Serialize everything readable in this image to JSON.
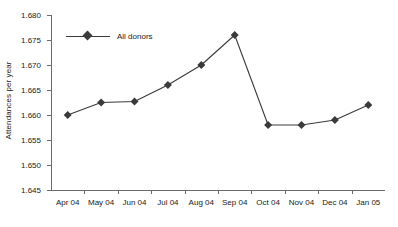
{
  "chart_data": {
    "type": "line",
    "title": "",
    "xlabel": "",
    "ylabel": "Attendances per year",
    "categories": [
      "Apr 04",
      "May 04",
      "Jun 04",
      "Jul 04",
      "Aug 04",
      "Sep 04",
      "Oct 04",
      "Nov 04",
      "Dec 04",
      "Jan 05"
    ],
    "series": [
      {
        "name": "All donors",
        "values": [
          1.66,
          1.6625,
          1.6627,
          1.666,
          1.67,
          1.676,
          1.658,
          1.658,
          1.659,
          1.662
        ],
        "color": "#3a3a3a",
        "marker": "diamond"
      }
    ],
    "ylim": [
      1.645,
      1.68
    ],
    "ytick_step": 0.005,
    "ytick_labels": [
      "1.680",
      "1.675",
      "1.670",
      "1.665",
      "1.660",
      "1.655",
      "1.650",
      "1.645"
    ],
    "ytick_values": [
      1.68,
      1.675,
      1.67,
      1.665,
      1.66,
      1.655,
      1.65,
      1.645
    ],
    "grid": false,
    "legend_position": "top-left-inside",
    "axis_color": "#6b6b6b",
    "text_color": "#1a1a1a",
    "background": "#ffffff"
  },
  "legend": {
    "entries": [
      {
        "label": "All donors"
      }
    ]
  }
}
